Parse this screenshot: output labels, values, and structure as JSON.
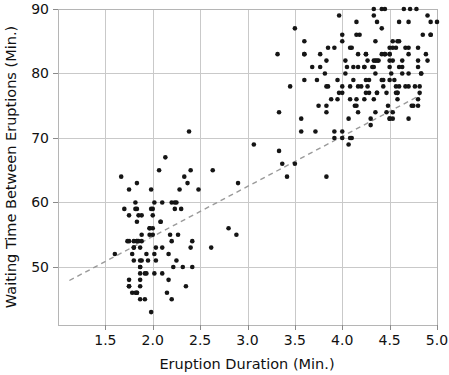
{
  "chart_data": {
    "type": "scatter",
    "title": "",
    "xlabel": "Eruption Duration (Min.)",
    "ylabel": "Waiting Time Between Eruptions (Min.)",
    "xlim": [
      1.0,
      5.0
    ],
    "ylim": [
      41.0,
      90.0
    ],
    "xticks": [
      1.5,
      2.0,
      2.5,
      3.0,
      3.5,
      4.0,
      4.5,
      5.0
    ],
    "xticklabels": [
      "1.5",
      "2.0",
      "2.5",
      "3.0",
      "3.5",
      "4.0",
      "4.5",
      "5.0"
    ],
    "yticks": [
      50,
      60,
      70,
      80,
      90
    ],
    "yticklabels": [
      "50",
      "60",
      "70",
      "80",
      "90"
    ],
    "grid": true,
    "legend": null,
    "marker": {
      "shape": "circle",
      "size_px": 4.6,
      "color": "#151515"
    },
    "annotations": [
      {
        "kind": "trendline",
        "style": "dashed",
        "color": "#9a9a9a",
        "x0": 1.12,
        "y0": 47.9,
        "x1": 4.82,
        "y1": 76.6
      }
    ],
    "series": [
      {
        "name": "Old Faithful eruptions",
        "points": [
          [
            3.6,
            79.0
          ],
          [
            1.8,
            54.0
          ],
          [
            3.333,
            74.0
          ],
          [
            2.283,
            62.0
          ],
          [
            4.533,
            85.0
          ],
          [
            2.883,
            55.0
          ],
          [
            4.7,
            88.0
          ],
          [
            3.6,
            85.0
          ],
          [
            1.95,
            51.0
          ],
          [
            4.35,
            85.0
          ],
          [
            1.833,
            54.0
          ],
          [
            3.917,
            84.0
          ],
          [
            4.2,
            78.0
          ],
          [
            1.75,
            47.0
          ],
          [
            4.7,
            83.0
          ],
          [
            2.167,
            52.0
          ],
          [
            1.75,
            62.0
          ],
          [
            4.8,
            84.0
          ],
          [
            1.6,
            52.0
          ],
          [
            4.25,
            79.0
          ],
          [
            1.8,
            51.0
          ],
          [
            1.75,
            47.0
          ],
          [
            3.45,
            78.0
          ],
          [
            3.067,
            69.0
          ],
          [
            4.533,
            74.0
          ],
          [
            3.6,
            83.0
          ],
          [
            1.967,
            55.0
          ],
          [
            4.083,
            76.0
          ],
          [
            3.85,
            78.0
          ],
          [
            4.433,
            79.0
          ],
          [
            4.3,
            73.0
          ],
          [
            4.467,
            77.0
          ],
          [
            3.367,
            66.0
          ],
          [
            4.033,
            80.0
          ],
          [
            3.833,
            74.0
          ],
          [
            2.017,
            52.0
          ],
          [
            1.867,
            48.0
          ],
          [
            4.833,
            80.0
          ],
          [
            1.833,
            59.0
          ],
          [
            4.783,
            90.0
          ],
          [
            4.35,
            80.0
          ],
          [
            1.883,
            58.0
          ],
          [
            4.567,
            84.0
          ],
          [
            1.75,
            58.0
          ],
          [
            4.533,
            73.0
          ],
          [
            3.317,
            83.0
          ],
          [
            3.833,
            64.0
          ],
          [
            2.1,
            53.0
          ],
          [
            4.633,
            82.0
          ],
          [
            2.0,
            59.0
          ],
          [
            4.8,
            75.0
          ],
          [
            4.716,
            90.0
          ],
          [
            1.833,
            54.0
          ],
          [
            4.833,
            80.0
          ],
          [
            1.733,
            54.0
          ],
          [
            4.883,
            83.0
          ],
          [
            3.717,
            71.0
          ],
          [
            1.667,
            64.0
          ],
          [
            4.567,
            77.0
          ],
          [
            4.317,
            81.0
          ],
          [
            2.233,
            59.0
          ],
          [
            4.5,
            84.0
          ],
          [
            1.75,
            48.0
          ],
          [
            4.8,
            82.0
          ],
          [
            1.817,
            60.0
          ],
          [
            4.4,
            92.0
          ],
          [
            4.167,
            78.0
          ],
          [
            4.7,
            78.0
          ],
          [
            2.067,
            65.0
          ],
          [
            4.7,
            73.0
          ],
          [
            4.033,
            82.0
          ],
          [
            1.967,
            56.0
          ],
          [
            4.5,
            79.0
          ],
          [
            4.0,
            71.0
          ],
          [
            1.983,
            62.0
          ],
          [
            5.067,
            76.0
          ],
          [
            2.017,
            60.0
          ],
          [
            4.567,
            78.0
          ],
          [
            3.883,
            76.0
          ],
          [
            3.6,
            83.0
          ],
          [
            4.133,
            75.0
          ],
          [
            4.333,
            82.0
          ],
          [
            4.1,
            70.0
          ],
          [
            2.633,
            65.0
          ],
          [
            4.067,
            73.0
          ],
          [
            4.933,
            88.0
          ],
          [
            3.95,
            76.0
          ],
          [
            4.517,
            80.0
          ],
          [
            2.167,
            48.0
          ],
          [
            4.0,
            86.0
          ],
          [
            2.2,
            60.0
          ],
          [
            4.333,
            90.0
          ],
          [
            1.867,
            50.0
          ],
          [
            4.817,
            78.0
          ],
          [
            1.833,
            63.0
          ],
          [
            4.3,
            72.0
          ],
          [
            4.667,
            84.0
          ],
          [
            3.75,
            75.0
          ],
          [
            1.867,
            51.0
          ],
          [
            4.9,
            82.0
          ],
          [
            2.483,
            62.0
          ],
          [
            4.367,
            88.0
          ],
          [
            2.1,
            49.0
          ],
          [
            4.5,
            83.0
          ],
          [
            4.05,
            81.0
          ],
          [
            1.867,
            47.0
          ],
          [
            4.7,
            84.0
          ],
          [
            1.783,
            52.0
          ],
          [
            4.85,
            86.0
          ],
          [
            3.683,
            81.0
          ],
          [
            4.733,
            75.0
          ],
          [
            2.3,
            59.0
          ],
          [
            4.9,
            89.0
          ],
          [
            4.417,
            79.0
          ],
          [
            1.7,
            59.0
          ],
          [
            4.633,
            81.0
          ],
          [
            2.317,
            50.0
          ],
          [
            4.6,
            85.0
          ],
          [
            1.817,
            59.0
          ],
          [
            4.417,
            87.0
          ],
          [
            2.617,
            53.0
          ],
          [
            4.067,
            69.0
          ],
          [
            4.25,
            77.0
          ],
          [
            1.967,
            56.0
          ],
          [
            4.6,
            88.0
          ],
          [
            3.767,
            81.0
          ],
          [
            1.917,
            45.0
          ],
          [
            4.5,
            82.0
          ],
          [
            2.267,
            55.0
          ],
          [
            4.65,
            90.0
          ],
          [
            1.867,
            45.0
          ],
          [
            4.167,
            83.0
          ],
          [
            2.8,
            56.0
          ],
          [
            4.333,
            89.0
          ],
          [
            1.833,
            46.0
          ],
          [
            4.383,
            82.0
          ],
          [
            1.883,
            51.0
          ],
          [
            4.933,
            86.0
          ],
          [
            2.033,
            53.0
          ],
          [
            3.733,
            79.0
          ],
          [
            4.233,
            81.0
          ],
          [
            2.233,
            60.0
          ],
          [
            4.533,
            82.0
          ],
          [
            4.817,
            77.0
          ],
          [
            4.333,
            76.0
          ],
          [
            1.983,
            59.0
          ],
          [
            4.633,
            80.0
          ],
          [
            2.017,
            49.0
          ],
          [
            5.1,
            96.0
          ],
          [
            1.8,
            53.0
          ],
          [
            5.033,
            77.0
          ],
          [
            4.0,
            77.0
          ],
          [
            2.4,
            65.0
          ],
          [
            4.6,
            81.0
          ],
          [
            3.567,
            71.0
          ],
          [
            4.0,
            70.0
          ],
          [
            4.5,
            81.0
          ],
          [
            4.083,
            93.0
          ],
          [
            1.8,
            53.0
          ],
          [
            3.967,
            89.0
          ],
          [
            2.2,
            45.0
          ],
          [
            4.15,
            86.0
          ],
          [
            2.0,
            58.0
          ],
          [
            3.833,
            78.0
          ],
          [
            3.5,
            66.0
          ],
          [
            4.583,
            76.0
          ],
          [
            2.367,
            63.0
          ],
          [
            5.0,
            88.0
          ],
          [
            1.933,
            52.0
          ],
          [
            4.617,
            93.0
          ],
          [
            1.917,
            49.0
          ],
          [
            2.083,
            57.0
          ],
          [
            4.583,
            77.0
          ],
          [
            3.333,
            68.0
          ],
          [
            4.167,
            81.0
          ],
          [
            4.333,
            81.0
          ],
          [
            4.5,
            73.0
          ],
          [
            2.417,
            50.0
          ],
          [
            4.0,
            85.0
          ],
          [
            4.167,
            74.0
          ],
          [
            1.883,
            55.0
          ],
          [
            4.583,
            77.0
          ],
          [
            4.25,
            83.0
          ],
          [
            3.767,
            83.0
          ],
          [
            2.033,
            51.0
          ],
          [
            4.433,
            78.0
          ],
          [
            4.083,
            84.0
          ],
          [
            1.833,
            46.0
          ],
          [
            4.417,
            83.0
          ],
          [
            2.183,
            55.0
          ],
          [
            4.8,
            81.0
          ],
          [
            1.833,
            57.0
          ],
          [
            4.8,
            76.0
          ],
          [
            4.1,
            84.0
          ],
          [
            3.966,
            77.0
          ],
          [
            4.233,
            81.0
          ],
          [
            3.5,
            87.0
          ],
          [
            4.366,
            77.0
          ],
          [
            2.25,
            51.0
          ],
          [
            4.667,
            78.0
          ],
          [
            2.1,
            60.0
          ],
          [
            4.35,
            82.0
          ],
          [
            4.133,
            91.0
          ],
          [
            1.867,
            53.0
          ],
          [
            4.6,
            78.0
          ],
          [
            1.783,
            46.0
          ],
          [
            4.367,
            77.0
          ],
          [
            3.85,
            84.0
          ],
          [
            1.933,
            49.0
          ],
          [
            4.5,
            83.0
          ],
          [
            2.383,
            71.0
          ],
          [
            4.7,
            80.0
          ],
          [
            1.867,
            49.0
          ],
          [
            3.833,
            75.0
          ],
          [
            3.417,
            64.0
          ],
          [
            4.233,
            76.0
          ],
          [
            2.4,
            53.0
          ],
          [
            4.8,
            94.0
          ],
          [
            2.0,
            55.0
          ],
          [
            4.15,
            76.0
          ],
          [
            1.867,
            50.0
          ],
          [
            4.267,
            82.0
          ],
          [
            1.75,
            54.0
          ],
          [
            4.483,
            75.0
          ],
          [
            4.0,
            78.0
          ],
          [
            4.117,
            79.0
          ],
          [
            4.083,
            78.0
          ],
          [
            4.267,
            78.0
          ],
          [
            3.917,
            70.0
          ],
          [
            4.55,
            79.0
          ],
          [
            4.083,
            70.0
          ],
          [
            2.417,
            54.0
          ],
          [
            4.183,
            86.0
          ],
          [
            2.217,
            50.0
          ],
          [
            4.45,
            90.0
          ],
          [
            1.883,
            54.0
          ],
          [
            1.85,
            54.0
          ],
          [
            4.283,
            77.0
          ],
          [
            3.95,
            79.0
          ],
          [
            2.333,
            64.0
          ],
          [
            4.15,
            75.0
          ],
          [
            2.35,
            47.0
          ],
          [
            4.933,
            86.0
          ],
          [
            2.9,
            63.0
          ],
          [
            4.583,
            85.0
          ],
          [
            3.833,
            82.0
          ],
          [
            2.083,
            57.0
          ],
          [
            4.367,
            82.0
          ],
          [
            2.133,
            67.0
          ],
          [
            4.35,
            74.0
          ],
          [
            2.2,
            54.0
          ],
          [
            4.45,
            83.0
          ],
          [
            3.567,
            73.0
          ],
          [
            4.5,
            73.0
          ],
          [
            4.15,
            88.0
          ],
          [
            3.817,
            80.0
          ],
          [
            3.917,
            71.0
          ],
          [
            4.45,
            83.0
          ],
          [
            2.0,
            56.0
          ],
          [
            4.283,
            79.0
          ],
          [
            4.767,
            78.0
          ],
          [
            4.533,
            84.0
          ],
          [
            1.85,
            58.0
          ],
          [
            4.25,
            83.0
          ],
          [
            1.983,
            43.0
          ],
          [
            2.25,
            60.0
          ],
          [
            4.75,
            75.0
          ],
          [
            4.117,
            81.0
          ],
          [
            2.15,
            46.0
          ],
          [
            4.417,
            90.0
          ],
          [
            1.817,
            46.0
          ],
          [
            4.467,
            74.0
          ]
        ]
      }
    ]
  }
}
